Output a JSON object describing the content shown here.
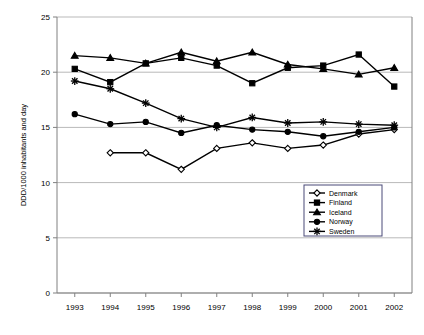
{
  "chart_data": {
    "type": "line",
    "title": "",
    "xlabel": "",
    "ylabel": "DDD/1000 inhabitants and day",
    "x": [
      1993,
      1994,
      1995,
      1996,
      1997,
      1998,
      1999,
      2000,
      2001,
      2002
    ],
    "xtick_labels": [
      "1993",
      "1994",
      "1995",
      "1996",
      "1997",
      "1998",
      "1999",
      "2000",
      "2001",
      "2002"
    ],
    "ytick_labels": [
      "0",
      "5",
      "10",
      "15",
      "20",
      "25"
    ],
    "yticks": [
      0,
      5,
      10,
      15,
      20,
      25
    ],
    "ylim": [
      0,
      25
    ],
    "grid": true,
    "legend_position": "inside-bottom-right",
    "series": [
      {
        "name": "Denmark",
        "marker": "open-diamond",
        "values": [
          null,
          12.7,
          12.7,
          11.2,
          13.1,
          13.6,
          13.1,
          13.4,
          14.4,
          14.8
        ]
      },
      {
        "name": "Finland",
        "marker": "filled-square",
        "values": [
          20.3,
          19.1,
          20.8,
          21.3,
          20.6,
          19.0,
          20.4,
          20.6,
          21.6,
          18.7
        ]
      },
      {
        "name": "Iceland",
        "marker": "filled-triangle",
        "values": [
          21.5,
          21.3,
          20.8,
          21.8,
          21.0,
          21.8,
          20.7,
          20.3,
          19.8,
          20.4
        ]
      },
      {
        "name": "Norway",
        "marker": "filled-circle",
        "values": [
          16.2,
          15.3,
          15.5,
          14.5,
          15.2,
          14.8,
          14.6,
          14.2,
          14.6,
          15.0
        ]
      },
      {
        "name": "Sweden",
        "marker": "asterisk",
        "values": [
          19.2,
          18.5,
          17.2,
          15.8,
          15.0,
          15.9,
          15.4,
          15.5,
          15.3,
          15.2
        ]
      }
    ]
  }
}
